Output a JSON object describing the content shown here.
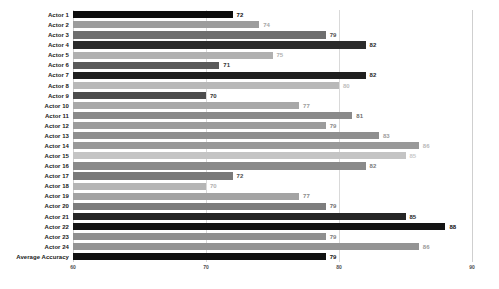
{
  "chart_data": {
    "type": "bar",
    "orientation": "horizontal",
    "title": "",
    "xlabel": "",
    "ylabel": "",
    "xlim": [
      60,
      90
    ],
    "xticks": [
      60,
      70,
      80,
      90
    ],
    "grid": true,
    "legend": "none",
    "categories": [
      "Actor 1",
      "Actor 2",
      "Actor 3",
      "Actor 4",
      "Actor 5",
      "Actor 6",
      "Actor 7",
      "Actor 8",
      "Actor 9",
      "Actor 10",
      "Actor 11",
      "Actor 12",
      "Actor 13",
      "Actor 14",
      "Actor 15",
      "Actor 16",
      "Actor 17",
      "Actor 18",
      "Actor 19",
      "Actor 20",
      "Actor 21",
      "Actor 22",
      "Actor 23",
      "Actor 24",
      "Average Accuracy"
    ],
    "values": [
      72,
      74,
      79,
      82,
      75,
      71,
      82,
      80,
      70,
      77,
      81,
      79,
      83,
      86,
      85,
      82,
      72,
      70,
      77,
      79,
      85,
      88,
      79,
      86,
      79
    ],
    "bar_colors": [
      "#0d0d0d",
      "#9c9c9c",
      "#6e6e6e",
      "#2b2b2b",
      "#b0b0b0",
      "#5a5a5a",
      "#1f1f1f",
      "#b8b8b8",
      "#4d4d4d",
      "#a8a8a8",
      "#8a8a8a",
      "#9c9c9c",
      "#8f8f8f",
      "#999999",
      "#c4c4c4",
      "#8a8a8a",
      "#7a7a7a",
      "#b5b5b5",
      "#a3a3a3",
      "#7d7d7d",
      "#262626",
      "#141414",
      "#8f8f8f",
      "#949494",
      "#111111"
    ],
    "label_colors": [
      "#111111",
      "#a5a5a5",
      "#4d4d4d",
      "#1f1f1f",
      "#b0b0b0",
      "#333333",
      "#1f1f1f",
      "#bdbdbd",
      "#333333",
      "#9c9c9c",
      "#6e6e6e",
      "#8a8a8a",
      "#9c9c9c",
      "#b8b8b8",
      "#c9c9c9",
      "#7a7a7a",
      "#4d4d4d",
      "#b0b0b0",
      "#8a8a8a",
      "#6e6e6e",
      "#1f1f1f",
      "#111111",
      "#7a7a7a",
      "#999999",
      "#111111"
    ]
  },
  "axis": {
    "tick_labels": [
      "60",
      "70",
      "80",
      "90"
    ]
  }
}
